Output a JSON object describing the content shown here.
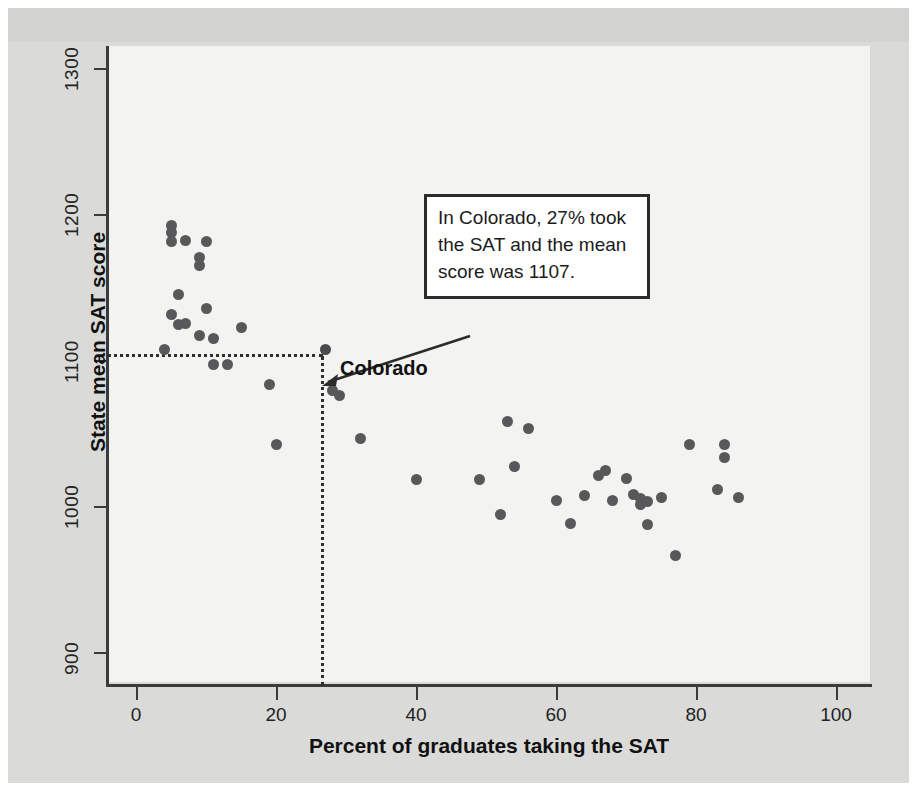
{
  "chart_data": {
    "type": "scatter",
    "title": "",
    "xlabel": "Percent of graduates taking the SAT",
    "ylabel": "State mean SAT score",
    "xlim": [
      0,
      105
    ],
    "ylim": [
      880,
      1320
    ],
    "xticks": [
      0,
      20,
      40,
      60,
      80,
      100
    ],
    "yticks": [
      900,
      1000,
      1100,
      1200,
      1300
    ],
    "grid": false,
    "legend": null,
    "marker_color": "#58585a",
    "points": [
      {
        "x": 5,
        "y": 1192
      },
      {
        "x": 5,
        "y": 1187
      },
      {
        "x": 5,
        "y": 1181
      },
      {
        "x": 7,
        "y": 1182
      },
      {
        "x": 10,
        "y": 1181
      },
      {
        "x": 9,
        "y": 1170
      },
      {
        "x": 9,
        "y": 1165
      },
      {
        "x": 6,
        "y": 1145
      },
      {
        "x": 5,
        "y": 1131
      },
      {
        "x": 6,
        "y": 1124
      },
      {
        "x": 7,
        "y": 1125
      },
      {
        "x": 10,
        "y": 1135
      },
      {
        "x": 9,
        "y": 1117
      },
      {
        "x": 11,
        "y": 1115
      },
      {
        "x": 15,
        "y": 1122
      },
      {
        "x": 11,
        "y": 1097
      },
      {
        "x": 13,
        "y": 1097
      },
      {
        "x": 4,
        "y": 1107
      },
      {
        "x": 19,
        "y": 1083
      },
      {
        "x": 20,
        "y": 1042
      },
      {
        "x": 27,
        "y": 1107
      },
      {
        "x": 28,
        "y": 1079
      },
      {
        "x": 29,
        "y": 1076
      },
      {
        "x": 32,
        "y": 1046
      },
      {
        "x": 40,
        "y": 1018
      },
      {
        "x": 49,
        "y": 1018
      },
      {
        "x": 52,
        "y": 994
      },
      {
        "x": 53,
        "y": 1058
      },
      {
        "x": 54,
        "y": 1027
      },
      {
        "x": 56,
        "y": 1053
      },
      {
        "x": 60,
        "y": 1004
      },
      {
        "x": 62,
        "y": 988
      },
      {
        "x": 64,
        "y": 1007
      },
      {
        "x": 66,
        "y": 1021
      },
      {
        "x": 67,
        "y": 1024
      },
      {
        "x": 68,
        "y": 1004
      },
      {
        "x": 70,
        "y": 1019
      },
      {
        "x": 71,
        "y": 1008
      },
      {
        "x": 72,
        "y": 1005
      },
      {
        "x": 72,
        "y": 1001
      },
      {
        "x": 73,
        "y": 1003
      },
      {
        "x": 73,
        "y": 987
      },
      {
        "x": 75,
        "y": 1006
      },
      {
        "x": 77,
        "y": 966
      },
      {
        "x": 79,
        "y": 1042
      },
      {
        "x": 83,
        "y": 1011
      },
      {
        "x": 84,
        "y": 1042
      },
      {
        "x": 84,
        "y": 1033
      },
      {
        "x": 86,
        "y": 1006
      }
    ],
    "highlight_point": {
      "x": 27,
      "y": 1107,
      "label": "Colorado"
    },
    "guide_lines": {
      "horizontal_y": 1107,
      "vertical_x": 27,
      "style": "dotted"
    },
    "annotation": {
      "lines": [
        "In Colorado, 27% took",
        "the SAT and the mean",
        "score was 1107."
      ],
      "text": "In Colorado, 27% took the SAT and the mean score was 1107.",
      "points_to": "Colorado"
    }
  },
  "axes": {
    "y_title": "State mean SAT score",
    "x_title": "Percent of graduates taking the SAT",
    "y_tick_labels": [
      "1300",
      "1200",
      "1100",
      "1000",
      "900"
    ],
    "x_tick_labels": [
      "0",
      "20",
      "40",
      "60",
      "80",
      "100"
    ]
  },
  "labels": {
    "colorado": "Colorado"
  },
  "colors": {
    "marker": "#58585a",
    "axis": "#3b3b3b",
    "panel": "#f3f3f1",
    "page": "#dadbd9",
    "callout_border": "#2b2b2b",
    "callout_fill": "#ffffff"
  }
}
